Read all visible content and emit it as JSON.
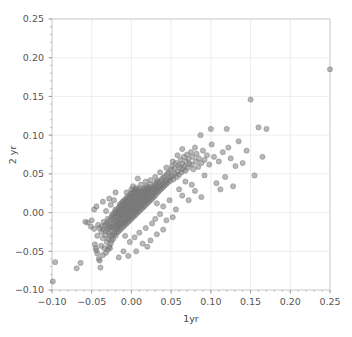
{
  "chart_data": {
    "type": "scatter",
    "title": "",
    "xlabel": "1yr",
    "ylabel": "2 yr",
    "xlim": [
      -0.1,
      0.25
    ],
    "ylim": [
      -0.1,
      0.25
    ],
    "xticks": [
      -0.1,
      -0.05,
      0.0,
      0.05,
      0.1,
      0.15,
      0.2,
      0.25
    ],
    "yticks": [
      -0.1,
      -0.05,
      0.0,
      0.05,
      0.1,
      0.15,
      0.2,
      0.25
    ],
    "xticklabels": [
      "-0.10",
      "-0.05",
      "0.00",
      "0.05",
      "0.10",
      "0.15",
      "0.20",
      "0.25"
    ],
    "yticklabels": [
      "-0.10",
      "-0.05",
      "0.00",
      "0.05",
      "0.10",
      "0.15",
      "0.20",
      "0.25"
    ],
    "minor_ticks": true,
    "grid": true,
    "grid_color": "#e8e8e8",
    "legend": null,
    "marker": {
      "shape": "circle",
      "color": "#7d7d7d",
      "edge_color": "#6e6e6e",
      "size": 4.2,
      "opacity": 0.55
    },
    "points": [
      [
        -0.099,
        -0.089
      ],
      [
        -0.096,
        -0.064
      ],
      [
        -0.069,
        -0.072
      ],
      [
        -0.064,
        -0.065
      ],
      [
        -0.058,
        -0.012
      ],
      [
        -0.055,
        -0.013
      ],
      [
        -0.051,
        -0.018
      ],
      [
        -0.05,
        -0.01
      ],
      [
        -0.047,
        -0.021
      ],
      [
        -0.046,
        -0.041
      ],
      [
        -0.045,
        -0.046
      ],
      [
        -0.044,
        -0.049
      ],
      [
        -0.043,
        -0.053
      ],
      [
        -0.043,
        -0.03
      ],
      [
        -0.042,
        -0.016
      ],
      [
        -0.041,
        -0.06
      ],
      [
        -0.04,
        -0.062
      ],
      [
        -0.04,
        -0.02
      ],
      [
        -0.039,
        -0.071
      ],
      [
        -0.038,
        -0.043
      ],
      [
        -0.038,
        -0.025
      ],
      [
        -0.037,
        -0.018
      ],
      [
        -0.036,
        -0.055
      ],
      [
        -0.036,
        -0.033
      ],
      [
        -0.035,
        -0.022
      ],
      [
        -0.035,
        -0.012
      ],
      [
        -0.034,
        -0.046
      ],
      [
        -0.033,
        -0.029
      ],
      [
        -0.033,
        -0.016
      ],
      [
        -0.032,
        -0.052
      ],
      [
        -0.032,
        -0.024
      ],
      [
        -0.031,
        -0.014
      ],
      [
        -0.031,
        -0.038
      ],
      [
        -0.03,
        -0.048
      ],
      [
        -0.03,
        -0.021
      ],
      [
        -0.03,
        -0.008
      ],
      [
        -0.029,
        -0.034
      ],
      [
        -0.029,
        -0.017
      ],
      [
        -0.028,
        -0.044
      ],
      [
        -0.028,
        -0.026
      ],
      [
        -0.028,
        -0.011
      ],
      [
        -0.027,
        -0.046
      ],
      [
        -0.027,
        -0.03
      ],
      [
        -0.027,
        -0.019
      ],
      [
        -0.026,
        -0.04
      ],
      [
        -0.026,
        -0.023
      ],
      [
        -0.026,
        -0.009
      ],
      [
        -0.025,
        -0.036
      ],
      [
        -0.025,
        -0.018
      ],
      [
        -0.025,
        -0.005
      ],
      [
        -0.024,
        -0.03
      ],
      [
        -0.024,
        -0.014
      ],
      [
        -0.024,
        -0.002
      ],
      [
        -0.023,
        -0.034
      ],
      [
        -0.023,
        -0.02
      ],
      [
        -0.023,
        -0.007
      ],
      [
        -0.022,
        -0.028
      ],
      [
        -0.022,
        -0.015
      ],
      [
        -0.022,
        -0.003
      ],
      [
        -0.021,
        -0.025
      ],
      [
        -0.021,
        -0.011
      ],
      [
        -0.021,
        0.001
      ],
      [
        -0.02,
        -0.03
      ],
      [
        -0.02,
        -0.018
      ],
      [
        -0.02,
        -0.006
      ],
      [
        -0.02,
        0.004
      ],
      [
        -0.019,
        -0.022
      ],
      [
        -0.019,
        -0.012
      ],
      [
        -0.019,
        -0.001
      ],
      [
        -0.018,
        -0.026
      ],
      [
        -0.018,
        -0.016
      ],
      [
        -0.018,
        -0.005
      ],
      [
        -0.018,
        0.003
      ],
      [
        -0.017,
        -0.02
      ],
      [
        -0.017,
        -0.01
      ],
      [
        -0.017,
        0.0
      ],
      [
        -0.016,
        -0.024
      ],
      [
        -0.016,
        -0.014
      ],
      [
        -0.016,
        -0.004
      ],
      [
        -0.016,
        0.006
      ],
      [
        -0.015,
        -0.018
      ],
      [
        -0.015,
        -0.008
      ],
      [
        -0.015,
        0.002
      ],
      [
        -0.015,
        0.01
      ],
      [
        -0.014,
        -0.022
      ],
      [
        -0.014,
        -0.012
      ],
      [
        -0.014,
        -0.002
      ],
      [
        -0.014,
        0.007
      ],
      [
        -0.013,
        -0.016
      ],
      [
        -0.013,
        -0.006
      ],
      [
        -0.013,
        0.004
      ],
      [
        -0.013,
        0.012
      ],
      [
        -0.012,
        -0.02
      ],
      [
        -0.012,
        -0.01
      ],
      [
        -0.012,
        0.0
      ],
      [
        -0.012,
        0.009
      ],
      [
        -0.011,
        -0.014
      ],
      [
        -0.011,
        -0.004
      ],
      [
        -0.011,
        0.005
      ],
      [
        -0.011,
        0.014
      ],
      [
        -0.01,
        -0.018
      ],
      [
        -0.01,
        -0.008
      ],
      [
        -0.01,
        0.002
      ],
      [
        -0.01,
        0.011
      ],
      [
        -0.009,
        -0.013
      ],
      [
        -0.009,
        -0.003
      ],
      [
        -0.009,
        0.007
      ],
      [
        -0.009,
        0.016
      ],
      [
        -0.008,
        -0.016
      ],
      [
        -0.008,
        -0.006
      ],
      [
        -0.008,
        0.004
      ],
      [
        -0.008,
        0.013
      ],
      [
        -0.007,
        -0.011
      ],
      [
        -0.007,
        -0.001
      ],
      [
        -0.007,
        0.009
      ],
      [
        -0.007,
        0.018
      ],
      [
        -0.006,
        -0.014
      ],
      [
        -0.006,
        -0.005
      ],
      [
        -0.006,
        0.005
      ],
      [
        -0.006,
        0.015
      ],
      [
        -0.005,
        -0.009
      ],
      [
        -0.005,
        0.001
      ],
      [
        -0.005,
        0.011
      ],
      [
        -0.005,
        0.02
      ],
      [
        -0.004,
        -0.012
      ],
      [
        -0.004,
        -0.003
      ],
      [
        -0.004,
        0.007
      ],
      [
        -0.004,
        0.017
      ],
      [
        -0.003,
        -0.007
      ],
      [
        -0.003,
        0.002
      ],
      [
        -0.003,
        0.012
      ],
      [
        -0.003,
        0.022
      ],
      [
        -0.002,
        -0.01
      ],
      [
        -0.002,
        0.0
      ],
      [
        -0.002,
        0.009
      ],
      [
        -0.002,
        0.019
      ],
      [
        -0.001,
        -0.005
      ],
      [
        -0.001,
        0.004
      ],
      [
        -0.001,
        0.014
      ],
      [
        -0.001,
        0.024
      ],
      [
        0.0,
        -0.008
      ],
      [
        0.0,
        0.002
      ],
      [
        0.0,
        0.011
      ],
      [
        0.0,
        0.021
      ],
      [
        0.001,
        -0.003
      ],
      [
        0.001,
        0.006
      ],
      [
        0.001,
        0.016
      ],
      [
        0.001,
        0.026
      ],
      [
        0.002,
        -0.006
      ],
      [
        0.002,
        0.004
      ],
      [
        0.002,
        0.013
      ],
      [
        0.002,
        0.023
      ],
      [
        0.003,
        -0.001
      ],
      [
        0.003,
        0.008
      ],
      [
        0.003,
        0.018
      ],
      [
        0.003,
        0.028
      ],
      [
        0.004,
        -0.004
      ],
      [
        0.004,
        0.006
      ],
      [
        0.004,
        0.015
      ],
      [
        0.004,
        0.025
      ],
      [
        0.005,
        0.001
      ],
      [
        0.005,
        0.01
      ],
      [
        0.005,
        0.02
      ],
      [
        0.005,
        0.03
      ],
      [
        0.006,
        -0.002
      ],
      [
        0.006,
        0.008
      ],
      [
        0.006,
        0.017
      ],
      [
        0.006,
        0.027
      ],
      [
        0.007,
        0.003
      ],
      [
        0.007,
        0.012
      ],
      [
        0.007,
        0.022
      ],
      [
        0.008,
        0.0
      ],
      [
        0.008,
        0.01
      ],
      [
        0.008,
        0.019
      ],
      [
        0.008,
        0.029
      ],
      [
        0.009,
        0.005
      ],
      [
        0.009,
        0.014
      ],
      [
        0.009,
        0.024
      ],
      [
        0.01,
        0.002
      ],
      [
        0.01,
        0.012
      ],
      [
        0.01,
        0.021
      ],
      [
        0.01,
        0.031
      ],
      [
        0.011,
        0.007
      ],
      [
        0.011,
        0.016
      ],
      [
        0.011,
        0.026
      ],
      [
        0.012,
        0.004
      ],
      [
        0.012,
        0.014
      ],
      [
        0.012,
        0.023
      ],
      [
        0.013,
        0.009
      ],
      [
        0.013,
        0.018
      ],
      [
        0.013,
        0.028
      ],
      [
        0.014,
        0.006
      ],
      [
        0.014,
        0.016
      ],
      [
        0.014,
        0.025
      ],
      [
        0.015,
        0.011
      ],
      [
        0.015,
        0.02
      ],
      [
        0.015,
        0.03
      ],
      [
        0.016,
        0.008
      ],
      [
        0.016,
        0.018
      ],
      [
        0.016,
        0.027
      ],
      [
        0.017,
        0.013
      ],
      [
        0.017,
        0.022
      ],
      [
        0.017,
        0.032
      ],
      [
        0.018,
        0.01
      ],
      [
        0.018,
        0.02
      ],
      [
        0.018,
        0.029
      ],
      [
        0.019,
        0.015
      ],
      [
        0.019,
        0.024
      ],
      [
        0.019,
        0.034
      ],
      [
        0.02,
        0.012
      ],
      [
        0.02,
        0.022
      ],
      [
        0.02,
        0.031
      ],
      [
        0.021,
        0.017
      ],
      [
        0.021,
        0.027
      ],
      [
        0.022,
        0.014
      ],
      [
        0.022,
        0.024
      ],
      [
        0.022,
        0.033
      ],
      [
        0.023,
        0.019
      ],
      [
        0.023,
        0.029
      ],
      [
        0.024,
        0.016
      ],
      [
        0.024,
        0.026
      ],
      [
        0.024,
        0.036
      ],
      [
        0.025,
        0.021
      ],
      [
        0.025,
        0.031
      ],
      [
        0.026,
        0.018
      ],
      [
        0.026,
        0.028
      ],
      [
        0.027,
        0.023
      ],
      [
        0.027,
        0.033
      ],
      [
        0.028,
        0.02
      ],
      [
        0.028,
        0.03
      ],
      [
        0.029,
        0.026
      ],
      [
        0.029,
        0.036
      ],
      [
        0.03,
        0.022
      ],
      [
        0.03,
        0.033
      ],
      [
        0.031,
        0.028
      ],
      [
        0.031,
        0.039
      ],
      [
        0.032,
        0.025
      ],
      [
        0.032,
        0.035
      ],
      [
        0.033,
        0.03
      ],
      [
        0.033,
        0.041
      ],
      [
        0.034,
        0.027
      ],
      [
        0.034,
        0.038
      ],
      [
        0.035,
        0.032
      ],
      [
        0.036,
        0.029
      ],
      [
        0.036,
        0.04
      ],
      [
        0.037,
        0.034
      ],
      [
        0.038,
        0.031
      ],
      [
        0.038,
        0.043
      ],
      [
        0.039,
        0.036
      ],
      [
        0.04,
        0.033
      ],
      [
        0.04,
        0.045
      ],
      [
        0.041,
        0.038
      ],
      [
        0.042,
        0.035
      ],
      [
        0.042,
        0.047
      ],
      [
        0.043,
        0.04
      ],
      [
        0.044,
        0.037
      ],
      [
        0.045,
        0.05
      ],
      [
        0.045,
        0.042
      ],
      [
        0.046,
        0.039
      ],
      [
        0.047,
        0.052
      ],
      [
        0.048,
        0.044
      ],
      [
        0.049,
        0.041
      ],
      [
        0.05,
        0.055
      ],
      [
        0.05,
        0.046
      ],
      [
        0.051,
        0.06
      ],
      [
        0.052,
        0.048
      ],
      [
        0.053,
        0.043
      ],
      [
        0.054,
        0.057
      ],
      [
        0.055,
        0.05
      ],
      [
        0.056,
        0.064
      ],
      [
        0.057,
        0.046
      ],
      [
        0.058,
        0.053
      ],
      [
        0.059,
        0.061
      ],
      [
        0.06,
        0.049
      ],
      [
        0.061,
        0.058
      ],
      [
        0.062,
        0.068
      ],
      [
        0.063,
        0.052
      ],
      [
        0.064,
        0.063
      ],
      [
        0.065,
        0.056
      ],
      [
        0.066,
        0.072
      ],
      [
        0.067,
        0.06
      ],
      [
        0.068,
        0.054
      ],
      [
        0.069,
        0.066
      ],
      [
        0.07,
        0.075
      ],
      [
        0.071,
        0.058
      ],
      [
        0.072,
        0.069
      ],
      [
        0.073,
        0.063
      ],
      [
        0.075,
        0.078
      ],
      [
        0.076,
        0.062
      ],
      [
        0.077,
        0.072
      ],
      [
        0.078,
        0.056
      ],
      [
        0.08,
        0.084
      ],
      [
        0.081,
        0.066
      ],
      [
        0.082,
        0.076
      ],
      [
        0.084,
        0.059
      ],
      [
        0.085,
        0.07
      ],
      [
        0.087,
        0.1
      ],
      [
        0.088,
        0.064
      ],
      [
        0.09,
        0.08
      ],
      [
        0.092,
        0.068
      ],
      [
        0.095,
        0.074
      ],
      [
        0.098,
        0.062
      ],
      [
        0.1,
        0.108
      ],
      [
        0.101,
        0.088
      ],
      [
        0.104,
        0.072
      ],
      [
        0.107,
        0.038
      ],
      [
        0.11,
        0.066
      ],
      [
        0.112,
        0.03
      ],
      [
        0.115,
        0.078
      ],
      [
        0.118,
        0.046
      ],
      [
        0.12,
        0.108
      ],
      [
        0.122,
        0.084
      ],
      [
        0.125,
        0.07
      ],
      [
        0.128,
        0.034
      ],
      [
        0.131,
        0.06
      ],
      [
        0.135,
        0.092
      ],
      [
        0.14,
        0.064
      ],
      [
        0.145,
        0.08
      ],
      [
        0.15,
        0.146
      ],
      [
        0.155,
        0.048
      ],
      [
        0.16,
        0.11
      ],
      [
        0.165,
        0.072
      ],
      [
        0.17,
        0.108
      ],
      [
        0.25,
        0.185
      ],
      [
        -0.047,
        0.004
      ],
      [
        -0.044,
        0.008
      ],
      [
        -0.036,
        0.014
      ],
      [
        -0.028,
        0.018
      ],
      [
        -0.02,
        0.026
      ],
      [
        0.032,
        0.012
      ],
      [
        0.04,
        0.008
      ],
      [
        0.048,
        0.016
      ],
      [
        0.056,
        0.004
      ],
      [
        0.064,
        0.022
      ],
      [
        0.072,
        0.016
      ],
      [
        0.08,
        0.028
      ],
      [
        0.088,
        0.02
      ],
      [
        0.03,
        -0.008
      ],
      [
        0.036,
        -0.002
      ],
      [
        0.044,
        -0.01
      ],
      [
        0.052,
        -0.006
      ],
      [
        0.026,
        -0.014
      ],
      [
        0.018,
        -0.02
      ],
      [
        0.01,
        -0.026
      ],
      [
        0.004,
        -0.032
      ],
      [
        -0.002,
        -0.038
      ],
      [
        -0.008,
        -0.03
      ],
      [
        0.014,
        -0.04
      ],
      [
        0.02,
        -0.044
      ],
      [
        0.006,
        -0.05
      ],
      [
        -0.004,
        -0.056
      ],
      [
        -0.01,
        -0.05
      ],
      [
        -0.016,
        -0.058
      ],
      [
        0.024,
        -0.036
      ],
      [
        0.032,
        -0.028
      ],
      [
        0.04,
        -0.022
      ],
      [
        0.06,
        0.03
      ],
      [
        0.068,
        0.04
      ],
      [
        0.076,
        0.036
      ],
      [
        0.092,
        0.048
      ],
      [
        0.012,
        0.036
      ],
      [
        0.006,
        0.032
      ],
      [
        0.0,
        0.03
      ],
      [
        -0.006,
        0.026
      ],
      [
        0.024,
        0.042
      ],
      [
        0.03,
        0.046
      ],
      [
        0.018,
        0.04
      ],
      [
        0.036,
        0.052
      ],
      [
        0.044,
        0.058
      ],
      [
        0.052,
        0.066
      ],
      [
        0.058,
        0.074
      ],
      [
        0.064,
        0.082
      ],
      [
        -0.032,
        0.002
      ],
      [
        -0.026,
        0.01
      ],
      [
        -0.022,
        0.016
      ],
      [
        0.002,
        0.034
      ],
      [
        0.008,
        0.044
      ]
    ]
  },
  "figure": {
    "background_color": "#ffffff",
    "axis_color": "#cccccc",
    "tick_color": "#999999",
    "label_color": "#555555"
  }
}
